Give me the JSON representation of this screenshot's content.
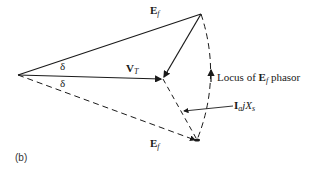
{
  "figure": {
    "panel_label": "(b)",
    "labels": {
      "ef_top": {
        "main": "E",
        "sub": "f"
      },
      "ef_bottom": {
        "main": "E",
        "sub": "f"
      },
      "vt": {
        "main": "V",
        "sub": "T"
      },
      "delta_top": "δ",
      "delta_bottom": "δ",
      "locus_prefix": "Locus of ",
      "locus_main": "E",
      "locus_sub": "f",
      "locus_suffix": " phasor",
      "iajxs_i": "I",
      "iajxs_a": "a",
      "iajxs_j": "j",
      "iajxs_x": "X",
      "iajxs_s": "s"
    },
    "points": {
      "origin": [
        18,
        75
      ],
      "ef_top_tip": [
        201,
        14
      ],
      "vt_tip": [
        163,
        79
      ],
      "ef_bottom_tip": [
        197,
        140
      ]
    },
    "colors": {
      "line": "#1a1a1a",
      "background": "#ffffff"
    }
  }
}
